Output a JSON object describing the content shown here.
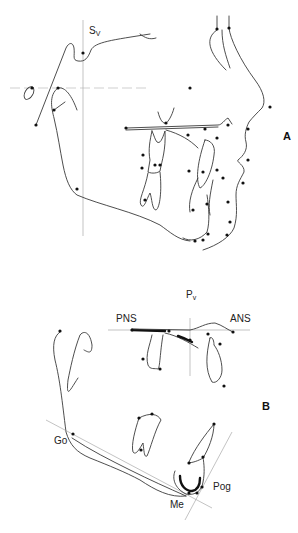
{
  "figure": {
    "panel_a": {
      "label": "A",
      "reference_labels": {
        "sv_main": "S",
        "sv_sub": "V"
      }
    },
    "panel_b": {
      "label": "B",
      "reference_labels": {
        "pv_main": "P",
        "pv_sub": "v"
      },
      "landmarks": {
        "pns": "PNS",
        "ans": "ANS",
        "go": "Go",
        "me": "Me",
        "pog": "Pog"
      }
    }
  }
}
